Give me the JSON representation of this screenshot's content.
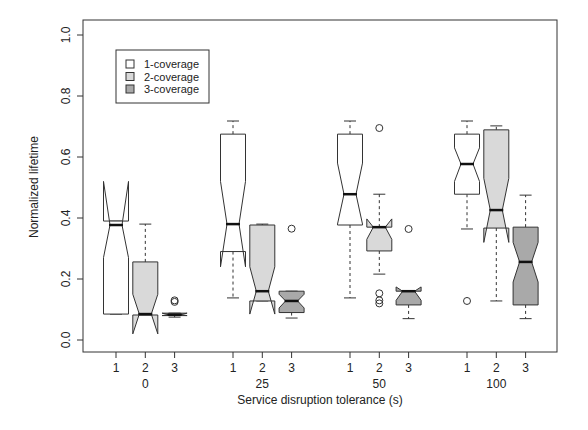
{
  "chart_data": {
    "type": "boxplot",
    "title": "",
    "xlabel": "Service disruption tolerance (s)",
    "ylabel": "Normalized lifetime",
    "ylim": [
      0.0,
      1.0
    ],
    "yticks": [
      "0.0",
      "0.2",
      "0.4",
      "0.6",
      "0.8",
      "1.0"
    ],
    "grid": false,
    "legend_position": "top-left",
    "groups": [
      "0",
      "25",
      "50",
      "100"
    ],
    "sub_tick_labels": [
      "1",
      "2",
      "3"
    ],
    "legend": [
      {
        "label": "1-coverage",
        "color": "#ffffff"
      },
      {
        "label": "2-coverage",
        "color": "#d9d9d9"
      },
      {
        "label": "3-coverage",
        "color": "#a9a9a9"
      }
    ],
    "series": [
      {
        "name": "1-coverage",
        "boxes": [
          {
            "group": "0",
            "whisker_low": 0.085,
            "q1": 0.085,
            "median": 0.377,
            "q3": 0.39,
            "whisker_high": 0.39,
            "notch_low": 0.27,
            "notch_high": 0.52,
            "outliers": []
          },
          {
            "group": "25",
            "whisker_low": 0.138,
            "q1": 0.29,
            "median": 0.38,
            "q3": 0.675,
            "whisker_high": 0.718,
            "notch_low": 0.24,
            "notch_high": 0.52,
            "outliers": []
          },
          {
            "group": "50",
            "whisker_low": 0.138,
            "q1": 0.377,
            "median": 0.478,
            "q3": 0.675,
            "whisker_high": 0.718,
            "notch_low": 0.38,
            "notch_high": 0.58,
            "outliers": []
          },
          {
            "group": "100",
            "whisker_low": 0.364,
            "q1": 0.478,
            "median": 0.577,
            "q3": 0.675,
            "whisker_high": 0.718,
            "notch_low": 0.52,
            "notch_high": 0.63,
            "outliers": [
              0.128
            ]
          }
        ]
      },
      {
        "name": "2-coverage",
        "boxes": [
          {
            "group": "0",
            "whisker_low": 0.082,
            "q1": 0.082,
            "median": 0.085,
            "q3": 0.256,
            "whisker_high": 0.38,
            "notch_low": 0.02,
            "notch_high": 0.15,
            "outliers": []
          },
          {
            "group": "25",
            "whisker_low": 0.128,
            "q1": 0.128,
            "median": 0.16,
            "q3": 0.377,
            "whisker_high": 0.38,
            "notch_low": 0.085,
            "notch_high": 0.24,
            "outliers": []
          },
          {
            "group": "50",
            "whisker_low": 0.216,
            "q1": 0.292,
            "median": 0.37,
            "q3": 0.37,
            "whisker_high": 0.478,
            "notch_low": 0.33,
            "notch_high": 0.397,
            "outliers": [
              0.695,
              0.153,
              0.13,
              0.12
            ]
          },
          {
            "group": "100",
            "whisker_low": 0.128,
            "q1": 0.367,
            "median": 0.426,
            "q3": 0.689,
            "whisker_high": 0.702,
            "notch_low": 0.32,
            "notch_high": 0.53,
            "outliers": []
          }
        ]
      },
      {
        "name": "3-coverage",
        "boxes": [
          {
            "group": "0",
            "whisker_low": 0.075,
            "q1": 0.08,
            "median": 0.083,
            "q3": 0.088,
            "whisker_high": 0.088,
            "notch_low": 0.08,
            "notch_high": 0.088,
            "outliers": [
              0.13,
              0.125
            ]
          },
          {
            "group": "25",
            "whisker_low": 0.072,
            "q1": 0.09,
            "median": 0.128,
            "q3": 0.16,
            "whisker_high": 0.16,
            "notch_low": 0.105,
            "notch_high": 0.15,
            "outliers": [
              0.365
            ]
          },
          {
            "group": "50",
            "whisker_low": 0.07,
            "q1": 0.115,
            "median": 0.16,
            "q3": 0.16,
            "whisker_high": 0.16,
            "notch_low": 0.13,
            "notch_high": 0.174,
            "outliers": [
              0.364
            ]
          },
          {
            "group": "100",
            "whisker_low": 0.07,
            "q1": 0.115,
            "median": 0.256,
            "q3": 0.37,
            "whisker_high": 0.475,
            "notch_low": 0.19,
            "notch_high": 0.32,
            "outliers": []
          }
        ]
      }
    ]
  }
}
